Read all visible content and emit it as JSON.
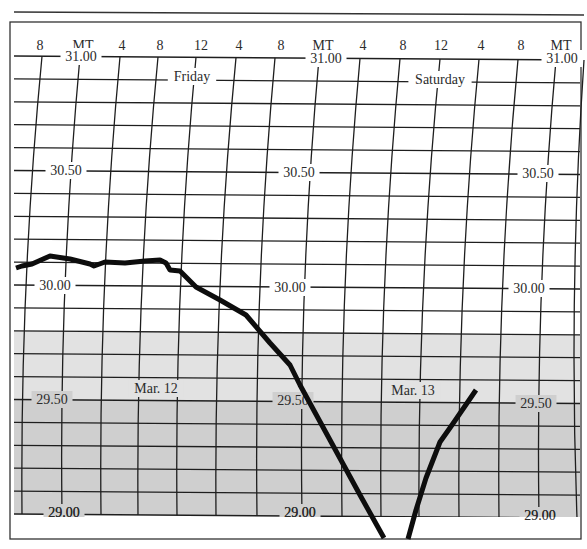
{
  "chart_data": {
    "type": "line",
    "title": "",
    "subtitle": "",
    "xlabel": "",
    "ylabel": "",
    "x_tick_labels": [
      "8",
      "MT",
      "4",
      "8",
      "12",
      "4",
      "8",
      "MT",
      "4",
      "8",
      "12",
      "4",
      "8",
      "MT"
    ],
    "day_labels": [
      "Friday",
      "Saturday"
    ],
    "date_labels": [
      "Mar. 12",
      "Mar. 13"
    ],
    "y_tick_labels": [
      "31.00",
      "30.50",
      "30.00",
      "29.50",
      "29.00"
    ],
    "ylim": [
      29.0,
      31.0
    ],
    "y_minor_step": 0.1,
    "grid": true,
    "legend": "none",
    "shaded_bands": [
      {
        "from": 29.5,
        "to": 29.8,
        "color": "#e2e2e2"
      },
      {
        "from": 29.0,
        "to": 29.5,
        "color": "#cfcfcf"
      }
    ],
    "series": [
      {
        "name": "Barometric pressure trace (inHg)",
        "segments": [
          {
            "x_hours": [
              -4.0,
              -3.0,
              -2.0,
              -1.0,
              0.0,
              1.0,
              2.0,
              3.0,
              4.0,
              5.0,
              6.0,
              7.0,
              8.0,
              9.0,
              10.0,
              11.0,
              12.0,
              13.0,
              14.0,
              16.0,
              18.0,
              20.0,
              22.0,
              24.0,
              26.0,
              28.0,
              30.0,
              30.8
            ],
            "values": [
              30.06,
              30.07,
              30.09,
              30.11,
              30.12,
              30.11,
              30.1,
              30.08,
              30.1,
              30.1,
              30.1,
              30.1,
              30.11,
              30.11,
              30.1,
              30.07,
              30.06,
              30.03,
              29.98,
              29.92,
              29.87,
              29.81,
              29.72,
              29.62,
              29.38,
              29.17,
              28.96,
              28.9
            ]
          },
          {
            "x_hours": [
              32.0,
              33.0,
              34.0,
              35.0,
              36.0,
              37.0
            ],
            "values": [
              28.9,
              29.05,
              29.2,
              29.32,
              29.43,
              29.55
            ]
          }
        ]
      }
    ],
    "annotations": [
      {
        "text": "Friday",
        "near": "31.00 row, noon Friday"
      },
      {
        "text": "Saturday",
        "near": "31.00 row, noon Saturday"
      },
      {
        "text": "Mar. 12",
        "near": "29.50 row, Friday"
      },
      {
        "text": "Mar. 13",
        "near": "29.50 row, Saturday"
      }
    ]
  },
  "labels": {
    "time_row": [
      {
        "text": "8",
        "x": 40
      },
      {
        "text": "MT",
        "x": 83
      },
      {
        "text": "4",
        "x": 122
      },
      {
        "text": "8",
        "x": 160
      },
      {
        "text": "12",
        "x": 201
      },
      {
        "text": "4",
        "x": 239
      },
      {
        "text": "8",
        "x": 281
      },
      {
        "text": "MT",
        "x": 323
      },
      {
        "text": "4",
        "x": 363
      },
      {
        "text": "8",
        "x": 403
      },
      {
        "text": "12",
        "x": 441
      },
      {
        "text": "4",
        "x": 481
      },
      {
        "text": "8",
        "x": 521
      },
      {
        "text": "MT",
        "x": 561
      }
    ],
    "pressure_left": [
      {
        "text": "31.00",
        "x": 81,
        "y": 61
      },
      {
        "text": "30.50",
        "x": 66,
        "y": 175
      },
      {
        "text": "30.00",
        "x": 55,
        "y": 290
      },
      {
        "text": "29.50",
        "x": 52,
        "y": 404
      },
      {
        "text": "29.00",
        "x": 64,
        "y": 517
      }
    ],
    "pressure_mid": [
      {
        "text": "31.00",
        "x": 326,
        "y": 63
      },
      {
        "text": "30.50",
        "x": 299,
        "y": 177
      },
      {
        "text": "30.00",
        "x": 290,
        "y": 292
      },
      {
        "text": "29.50",
        "x": 293,
        "y": 405
      },
      {
        "text": "29.00",
        "x": 300,
        "y": 517
      }
    ],
    "pressure_right": [
      {
        "text": "31.00",
        "x": 562,
        "y": 63
      },
      {
        "text": "30.50",
        "x": 538,
        "y": 178
      },
      {
        "text": "30.00",
        "x": 529,
        "y": 293
      },
      {
        "text": "29.50",
        "x": 536,
        "y": 408
      },
      {
        "text": "29.00",
        "x": 540,
        "y": 520
      }
    ],
    "friday": {
      "text": "Friday",
      "x": 192,
      "y": 81
    },
    "saturday": {
      "text": "Saturday",
      "x": 440,
      "y": 84
    },
    "mar12": {
      "text": "Mar. 12",
      "x": 156,
      "y": 393
    },
    "mar13": {
      "text": "Mar. 13",
      "x": 413,
      "y": 395
    }
  }
}
